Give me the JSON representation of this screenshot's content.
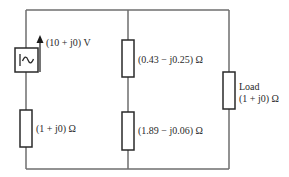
{
  "diagram": {
    "title": "",
    "colors": {
      "wire": "#6e6e6e",
      "component": "#2a2a2a",
      "background": "#ffffff"
    },
    "source": {
      "label": "(10 + j0) V",
      "symbol": "ac-source-icon",
      "glyph": "|~"
    },
    "components": [
      {
        "id": "R_source",
        "label": "(1 + j0) Ω",
        "branch": "left"
      },
      {
        "id": "Z1_top",
        "label": "(0.43 − j0.25) Ω",
        "branch": "middle"
      },
      {
        "id": "Z2_bottom",
        "label": "(1.89 − j0.06) Ω",
        "branch": "middle"
      },
      {
        "id": "Z_load",
        "name_label": "Load",
        "label": "(1 + j0) Ω",
        "branch": "right"
      }
    ]
  }
}
